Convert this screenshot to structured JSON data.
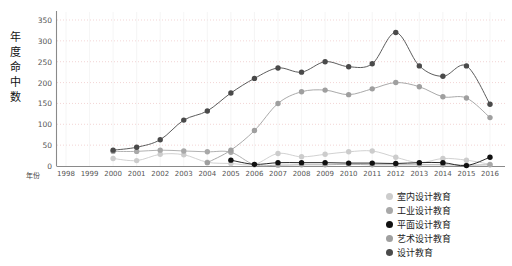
{
  "chart_data": {
    "type": "line",
    "title": "",
    "xlabel": "年份",
    "ylabel": "年度命中数",
    "x": [
      1998,
      1999,
      2000,
      2001,
      2002,
      2003,
      2004,
      2005,
      2006,
      2007,
      2008,
      2009,
      2010,
      2011,
      2012,
      2013,
      2014,
      2015,
      2016
    ],
    "xtick_labels": [
      "1998",
      "1999",
      "2000",
      "2001",
      "2002",
      "2003",
      "2004",
      "2005",
      "2006",
      "2007",
      "2008",
      "2009",
      "2010",
      "2011",
      "2012",
      "2013",
      "2014",
      "2015",
      "2016"
    ],
    "ylim": [
      0,
      350
    ],
    "ytick_labels": [
      "0",
      "50",
      "100",
      "150",
      "200",
      "250",
      "300",
      "350"
    ],
    "yticks": [
      0,
      50,
      100,
      150,
      200,
      250,
      300,
      350
    ],
    "grid": true,
    "legend_position": "bottom-right",
    "series": [
      {
        "name": "室内设计教育",
        "color": "#cccccc",
        "x": [
          2000,
          2001,
          2002,
          2003,
          2004,
          2005,
          2006,
          2007,
          2008,
          2009,
          2010,
          2011,
          2012,
          2013,
          2014,
          2015,
          2016
        ],
        "values": [
          18,
          13,
          28,
          27,
          9,
          6,
          4,
          30,
          22,
          28,
          34,
          36,
          21,
          8,
          18,
          14,
          4
        ]
      },
      {
        "name": "工业设计教育",
        "color": "#a8a8a8",
        "x": [
          2000,
          2001,
          2002,
          2003,
          2004,
          2005,
          2006,
          2007,
          2008,
          2009,
          2010,
          2011,
          2012,
          2013,
          2014,
          2015,
          2016
        ],
        "values": [
          35,
          35,
          38,
          36,
          34,
          33,
          3,
          2,
          3,
          3,
          4,
          3,
          3,
          3,
          3,
          2,
          3
        ]
      },
      {
        "name": "平面设计教育",
        "color": "#111111",
        "x": [
          2005,
          2006,
          2007,
          2008,
          2009,
          2010,
          2011,
          2012,
          2013,
          2014,
          2015,
          2016
        ],
        "values": [
          14,
          4,
          8,
          8,
          8,
          7,
          7,
          6,
          8,
          8,
          1,
          21
        ]
      },
      {
        "name": "艺术设计教育",
        "color": "#9f9f9f",
        "x": [
          2004,
          2005,
          2006,
          2007,
          2008,
          2009,
          2010,
          2011,
          2012,
          2013,
          2014,
          2015,
          2016
        ],
        "values": [
          8,
          38,
          85,
          150,
          178,
          182,
          171,
          185,
          200,
          190,
          166,
          163,
          116
        ]
      },
      {
        "name": "设计教育",
        "color": "#4a4a4a",
        "x": [
          2000,
          2001,
          2002,
          2003,
          2004,
          2005,
          2006,
          2007,
          2008,
          2009,
          2010,
          2011,
          2012,
          2013,
          2014,
          2015,
          2016
        ],
        "values": [
          38,
          45,
          63,
          110,
          132,
          175,
          210,
          235,
          225,
          250,
          238,
          245,
          320,
          240,
          215,
          240,
          148
        ]
      }
    ]
  },
  "legend": {
    "items": [
      {
        "label": "室内设计教育",
        "color": "#cccccc"
      },
      {
        "label": "工业设计教育",
        "color": "#a8a8a8"
      },
      {
        "label": "平面设计教育",
        "color": "#111111"
      },
      {
        "label": "艺术设计教育",
        "color": "#9f9f9f"
      },
      {
        "label": "设计教育",
        "color": "#4a4a4a"
      }
    ]
  },
  "axes": {
    "y_title": "年度命中数",
    "x_title": "年份"
  }
}
